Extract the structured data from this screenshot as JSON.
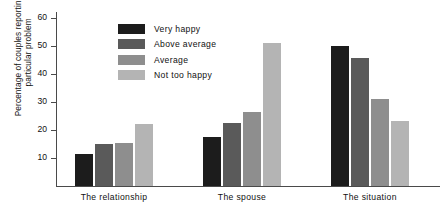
{
  "chart_data": {
    "type": "bar",
    "title": "",
    "xlabel": "",
    "ylabel": "Percentage of couples reporting a particular problem",
    "ylabel_lines": [
      "Percentage of couples reporting a",
      "particular problem"
    ],
    "ylim": [
      0,
      62
    ],
    "yticks": [
      10,
      20,
      30,
      40,
      50,
      60
    ],
    "ytick_labels": [
      "10",
      "20",
      "30",
      "40",
      "50",
      "60"
    ],
    "grid": false,
    "legend_position": "top-left inside plot",
    "categories": [
      "The relationship",
      "The spouse",
      "The situation"
    ],
    "series": [
      {
        "name": "Very happy",
        "color": "#1c1c1c",
        "values": [
          11.5,
          17.5,
          50.0
        ]
      },
      {
        "name": "Above average",
        "color": "#5a5a5a",
        "values": [
          15.0,
          22.5,
          45.5
        ]
      },
      {
        "name": "Average",
        "color": "#8e8e8e",
        "values": [
          15.5,
          26.5,
          31.0
        ]
      },
      {
        "name": "Not too happy",
        "color": "#b4b4b4",
        "values": [
          22.0,
          51.0,
          23.0
        ]
      }
    ]
  },
  "axis": {
    "color": "#4a4a4a"
  }
}
